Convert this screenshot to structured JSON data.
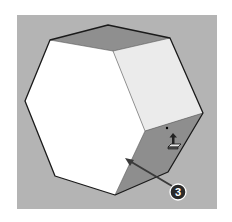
{
  "figure": {
    "background": "#ffffff",
    "canvas_color": "#b4b4b4",
    "shape": "hexagonal-prism",
    "faces": {
      "front": {
        "color": "#ffffff"
      },
      "top": {
        "color": "#8f8f8f"
      },
      "right_upper": {
        "color": "#ebebeb"
      },
      "right_lower": {
        "color": "#8e8e8e"
      }
    },
    "edge_color": "#1a1a1a",
    "cursor": {
      "name": "push-pull-tool-icon"
    },
    "callout": {
      "number": "3",
      "color": "#2a2a2a",
      "arrow_color": "#3a3a3a"
    }
  }
}
